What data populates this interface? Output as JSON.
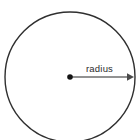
{
  "figure": {
    "background_color": "#ffffff",
    "labels": {
      "radius": "radius"
    },
    "colors": {
      "circle_stroke": "#2f2f2f",
      "arrow": "#6e6e6e",
      "center_dot": "#141414",
      "text": "#2b2b2b"
    },
    "geometry": {
      "circle_center_x": 70,
      "circle_center_y": 77,
      "circle_radius": 65,
      "circle_stroke_width": 1.4,
      "center_dot_radius": 2.8,
      "arrow_start_x": 72,
      "arrow_end_x": 134,
      "arrow_y": 77,
      "arrow_stroke_width": 1.3,
      "label_x": 86,
      "label_y": 72
    }
  }
}
